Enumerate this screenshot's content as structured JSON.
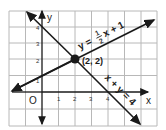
{
  "diagram": {
    "type": "coordinate-plane",
    "axes": {
      "x_label": "x",
      "y_label": "y",
      "origin_label": "O",
      "x_ticks": [
        "1",
        "2",
        "3",
        "4"
      ],
      "y_ticks": [
        "1",
        "2",
        "3",
        "4"
      ]
    },
    "lines": [
      {
        "name": "line-half-x-plus-1",
        "equation_prefix": "y =",
        "fraction_num": "1",
        "fraction_den": "2",
        "equation_suffix": "x + 1",
        "slope": 0.5,
        "intercept": 1
      },
      {
        "name": "line-x-plus-y-4",
        "equation": "x + y = 4",
        "slope": -1,
        "intercept": 4
      }
    ],
    "intersection": {
      "label": "(2, 2)",
      "x": 2,
      "y": 2
    },
    "colors": {
      "line": "#1a1a1a",
      "grid": "#b8b8b8",
      "background": "#ffffff"
    }
  }
}
